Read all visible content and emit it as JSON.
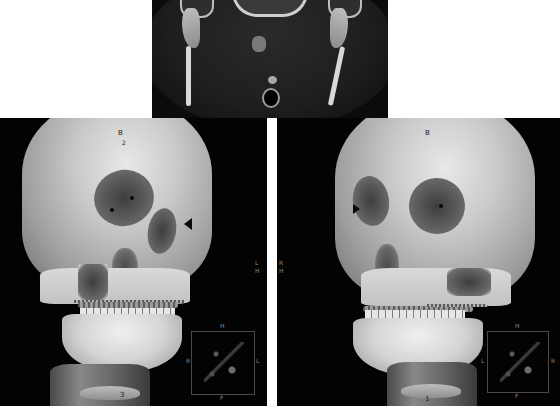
{
  "figure": {
    "panels": [
      {
        "id": "ct-axial",
        "type": "axial CT slice"
      },
      {
        "id": "vr-left",
        "type": "3D volume rendering, right anterior oblique"
      },
      {
        "id": "vr-right",
        "type": "3D volume rendering, left anterior oblique"
      }
    ]
  },
  "left_view": {
    "markers": {
      "frontal": "B",
      "frontal_sub": "2",
      "neck": "3"
    },
    "orientation": {
      "side_label": "L",
      "side_sub": "H",
      "cube_top": "H",
      "cube_left": "R",
      "cube_right": "L",
      "cube_bottom": "F"
    }
  },
  "right_view": {
    "markers": {
      "frontal": "B",
      "neck": "1"
    },
    "orientation": {
      "side_label": "R",
      "side_sub": "H",
      "cube_top": "H",
      "cube_left": "L",
      "cube_right": "R",
      "cube_bottom": "F"
    }
  },
  "colors": {
    "background": "#ffffff",
    "panel_bg": "#030303",
    "bone": "#d4d4d4"
  }
}
